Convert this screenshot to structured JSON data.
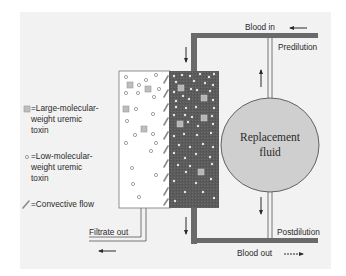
{
  "diagram": {
    "type": "hemofiltration-schematic",
    "colors": {
      "background_panel": "#f2f2f2",
      "blood_compartment": "#5c5c5c",
      "tubing": "#6a6a6a",
      "filtrate_compartment": "#ffffff",
      "replacement_fluid": "#cfcfcf",
      "large_toxin": "#bdbdbd",
      "small_toxin": "#e6e6e6",
      "text": "#2a2a2a"
    },
    "labels": {
      "blood_in": "Blood in",
      "blood_out": "Blood out",
      "predilution": "Predilution",
      "postdilution": "Postdilution",
      "filtrate_out": "Filtrate out",
      "replacement_fluid": "Replacement\nfluid"
    },
    "legend": {
      "items": [
        {
          "icon": "large-toxin-square-icon",
          "text": "=Large-molecular-\n  weight uremic\n  toxin"
        },
        {
          "icon": "small-toxin-circle-icon",
          "text": "=Low-molecular-\n  weight uremic\n  toxin"
        },
        {
          "icon": "convective-flow-icon",
          "text": "=Convective flow"
        }
      ]
    },
    "arrows": {
      "blood_in": "left",
      "blood_inlet_tube": "down",
      "blood_outlet_tube": "down",
      "blood_out": "right",
      "predilution": "up",
      "postdilution": "down",
      "filtrate_out": "left"
    }
  }
}
